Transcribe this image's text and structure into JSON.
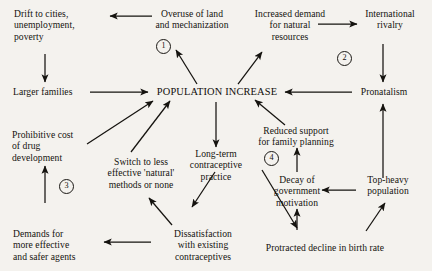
{
  "diagram": {
    "title_text": "Population increase feedback diagram",
    "background_color": "#f4f2ee",
    "ink_color": "#15130f",
    "center_node": {
      "label": "POPULATION INCREASE"
    },
    "nodes": [
      {
        "id": "drift",
        "label": "Drift to cities,\nunemployment,\npoverty"
      },
      {
        "id": "overuse",
        "label": "Overuse of land\nand mechanization"
      },
      {
        "id": "demand",
        "label": "Increased demand\nfor natural\nresources"
      },
      {
        "id": "rivalry",
        "label": "International\nrivalry"
      },
      {
        "id": "larger",
        "label": "Larger families"
      },
      {
        "id": "pronatalism",
        "label": "Pronatalism"
      },
      {
        "id": "prohibitive",
        "label": "Prohibitive cost\nof drug\ndevelopment"
      },
      {
        "id": "reduced",
        "label": "Reduced support\nfor family planning"
      },
      {
        "id": "switch",
        "label": "Switch to less\neffective 'natural'\nmethods or none"
      },
      {
        "id": "longterm",
        "label": "Long-term\ncontraceptive\npractice"
      },
      {
        "id": "decay",
        "label": "Decay of\ngovernment\nmotivation"
      },
      {
        "id": "topheavy",
        "label": "Top-heavy\npopulation"
      },
      {
        "id": "demands",
        "label": "Demands for\nmore effective\nand safer agents"
      },
      {
        "id": "dissatis",
        "label": "Dissatisfaction\nwith existing\ncontraceptives"
      },
      {
        "id": "protracted",
        "label": "Protracted decline in birth rate"
      }
    ],
    "loop_markers": [
      {
        "id": "loop-1",
        "label": "1"
      },
      {
        "id": "loop-2",
        "label": "2"
      },
      {
        "id": "loop-3",
        "label": "3"
      },
      {
        "id": "loop-4",
        "label": "4"
      }
    ],
    "edges": [
      {
        "from": "overuse",
        "to": "drift"
      },
      {
        "from": "demand",
        "to": "rivalry"
      },
      {
        "from": "drift",
        "to": "larger"
      },
      {
        "from": "rivalry",
        "to": "pronatalism"
      },
      {
        "from": "larger",
        "to": "center_node"
      },
      {
        "from": "pronatalism",
        "to": "center_node"
      },
      {
        "from": "center_node",
        "to": "overuse"
      },
      {
        "from": "center_node",
        "to": "demand"
      },
      {
        "from": "center_node",
        "to": "longterm"
      },
      {
        "from": "prohibitive",
        "to": "center_node"
      },
      {
        "from": "switch",
        "to": "center_node"
      },
      {
        "from": "reduced",
        "to": "center_node"
      },
      {
        "from": "demands",
        "to": "prohibitive"
      },
      {
        "from": "longterm",
        "to": "protracted"
      },
      {
        "from": "longterm",
        "to": "dissatis"
      },
      {
        "from": "dissatis",
        "to": "switch"
      },
      {
        "from": "dissatis",
        "to": "demands"
      },
      {
        "from": "protracted",
        "to": "decay"
      },
      {
        "from": "protracted",
        "to": "topheavy"
      },
      {
        "from": "topheavy",
        "to": "decay"
      },
      {
        "from": "topheavy",
        "to": "pronatalism"
      },
      {
        "from": "decay",
        "to": "reduced"
      }
    ]
  }
}
